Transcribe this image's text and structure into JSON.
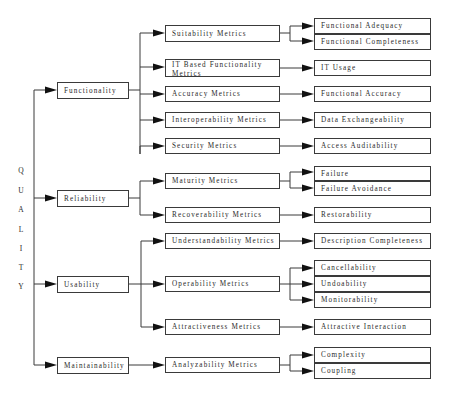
{
  "root": {
    "label_letters": [
      "Q",
      "U",
      "A",
      "L",
      "I",
      "T",
      "Y"
    ],
    "label": "QUALITY"
  },
  "characteristics": [
    {
      "label": "Functionality",
      "metrics": [
        {
          "label": "Suitability Metrics",
          "measures": [
            "Functional Adequacy",
            "Functional Completeness"
          ]
        },
        {
          "label": "IT Based Functionality Metrics",
          "measures": [
            "IT Usage"
          ]
        },
        {
          "label": "Accuracy Metrics",
          "measures": [
            "Functional Accuracy"
          ]
        },
        {
          "label": "Interoperability Metrics",
          "measures": [
            "Data Exchangeability"
          ]
        },
        {
          "label": "Security Metrics",
          "measures": [
            "Access Auditability"
          ]
        }
      ]
    },
    {
      "label": "Reliability",
      "metrics": [
        {
          "label": "Maturity Metrics",
          "measures": [
            "Failure",
            "Failure Avoidance"
          ]
        },
        {
          "label": "Recoverability Metrics",
          "measures": [
            "Restorability"
          ]
        }
      ]
    },
    {
      "label": "Usability",
      "metrics": [
        {
          "label": "Understandability Metrics",
          "measures": [
            "Description Completeness"
          ]
        },
        {
          "label": "Operability Metrics",
          "measures": [
            "Cancellability",
            "Undoability",
            "Monitorability"
          ]
        },
        {
          "label": "Attractiveness Metrics",
          "measures": [
            "Attractive Interaction"
          ]
        }
      ]
    },
    {
      "label": "Maintainability",
      "metrics": [
        {
          "label": "Analyzability Metrics",
          "measures": [
            "Complexity",
            "Coupling"
          ]
        }
      ]
    }
  ],
  "colors": {
    "line": "#3a3a3a",
    "arrowhead": "#111111",
    "text": "#2a2a2a",
    "background": "#ffffff"
  }
}
